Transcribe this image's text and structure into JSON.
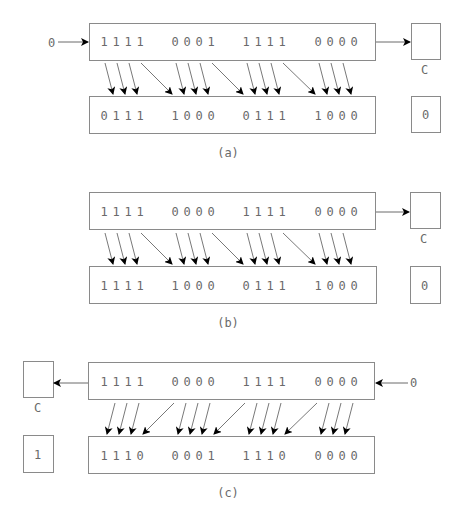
{
  "digit_x": [
    104,
    116,
    128,
    140,
    175,
    187,
    199,
    211,
    246,
    258,
    270,
    282,
    318,
    330,
    342,
    354
  ],
  "panels": [
    {
      "id": "a",
      "caption": "(a)",
      "direction": "right",
      "shift_in": "0",
      "carry_label": "C",
      "carry_result": "0",
      "top_bits": [
        "1",
        "1",
        "1",
        "1",
        "0",
        "0",
        "0",
        "1",
        "1",
        "1",
        "1",
        "1",
        "0",
        "0",
        "0",
        "0"
      ],
      "bottom_bits": [
        "0",
        "1",
        "1",
        "1",
        "1",
        "0",
        "0",
        "0",
        "0",
        "1",
        "1",
        "1",
        "1",
        "0",
        "0",
        "0"
      ]
    },
    {
      "id": "b",
      "caption": "(b)",
      "direction": "right",
      "shift_in": "",
      "carry_label": "C",
      "carry_result": "0",
      "top_bits": [
        "1",
        "1",
        "1",
        "1",
        "0",
        "0",
        "0",
        "0",
        "1",
        "1",
        "1",
        "1",
        "0",
        "0",
        "0",
        "0"
      ],
      "bottom_bits": [
        "1",
        "1",
        "1",
        "1",
        "1",
        "0",
        "0",
        "0",
        "0",
        "1",
        "1",
        "1",
        "1",
        "0",
        "0",
        "0"
      ]
    },
    {
      "id": "c",
      "caption": "(c)",
      "direction": "left",
      "shift_in": "0",
      "carry_label": "C",
      "carry_result": "1",
      "top_bits": [
        "1",
        "1",
        "1",
        "1",
        "0",
        "0",
        "0",
        "0",
        "1",
        "1",
        "1",
        "1",
        "0",
        "0",
        "0",
        "0"
      ],
      "bottom_bits": [
        "1",
        "1",
        "1",
        "0",
        "0",
        "0",
        "0",
        "1",
        "1",
        "1",
        "1",
        "0",
        "0",
        "0",
        "0",
        "0"
      ]
    }
  ],
  "colors": {
    "border": "#8a8a8a",
    "text": "#6a6a6a",
    "arrow": "#000000"
  }
}
